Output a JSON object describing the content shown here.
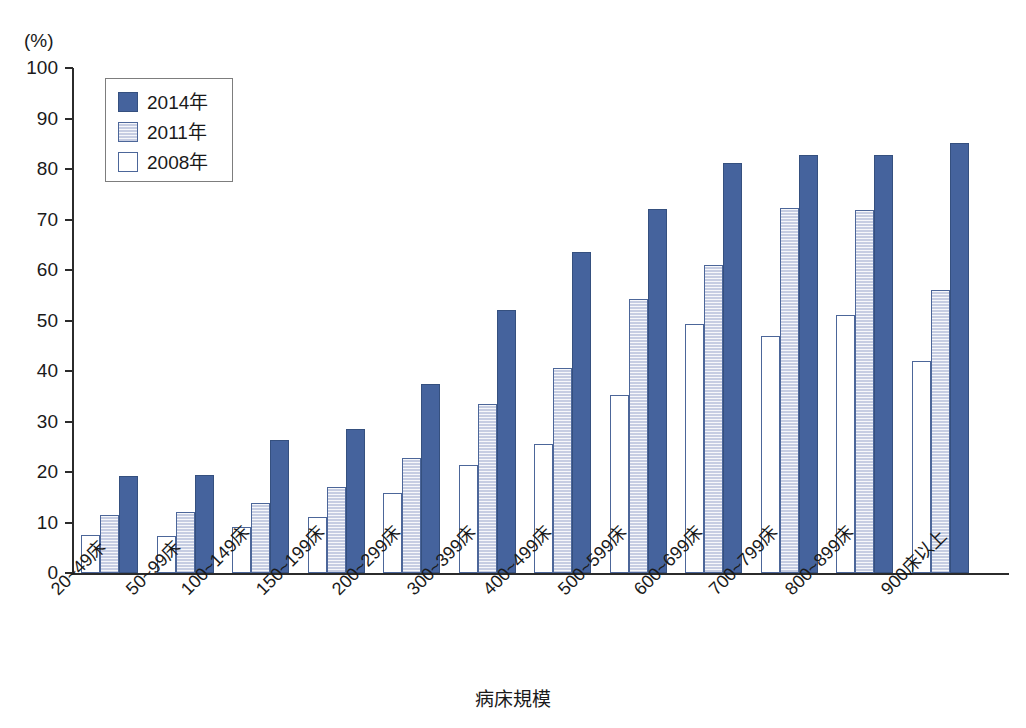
{
  "chart_data": {
    "type": "bar",
    "title": "",
    "xlabel": "病床規模",
    "ylabel": "(%)",
    "ylim": [
      0,
      100
    ],
    "ytick_step": 10,
    "yticks": [
      "100",
      "90",
      "80",
      "70",
      "60",
      "50",
      "40",
      "30",
      "20",
      "10",
      "0"
    ],
    "grid": false,
    "legend_position": "top-left",
    "categories": [
      "20~49床",
      "50~99床",
      "100~149床",
      "150~199床",
      "200~299床",
      "300~399床",
      "400~499床",
      "500~599床",
      "600~699床",
      "700~799床",
      "800~899床",
      "900床以上"
    ],
    "series": [
      {
        "name": "2008年",
        "color": "#ffffff",
        "border_color": "#4c6699",
        "values": [
          7.5,
          7.3,
          9.2,
          11.0,
          15.8,
          21.4,
          25.6,
          35.2,
          49.3,
          46.9,
          51.0,
          42.0
        ]
      },
      {
        "name": "2011年",
        "color": "#c6cde2",
        "border_color": "#4c6699",
        "values": [
          11.4,
          12.0,
          13.9,
          17.1,
          22.8,
          33.4,
          40.5,
          54.2,
          61.0,
          72.2,
          71.8,
          56.0
        ]
      },
      {
        "name": "2014年",
        "color": "#45639d",
        "border_color": "#35507f",
        "values": [
          19.2,
          19.4,
          26.3,
          28.6,
          37.4,
          52.1,
          63.5,
          72.0,
          81.1,
          82.8,
          82.8,
          85.2
        ]
      }
    ]
  },
  "axis": {
    "y_unit_label": "(%)",
    "x_title": "病床規模"
  },
  "legend": {
    "entries": [
      {
        "label": "2014年",
        "key": "y2014"
      },
      {
        "label": "2011年",
        "key": "y2011"
      },
      {
        "label": "2008年",
        "key": "y2008"
      }
    ]
  }
}
